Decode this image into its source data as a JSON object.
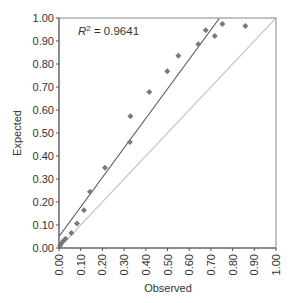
{
  "chart_data": {
    "type": "scatter",
    "title": "",
    "xlabel": "Observed",
    "ylabel": "Expected",
    "xlim": [
      0,
      1
    ],
    "ylim": [
      0,
      1
    ],
    "grid": false,
    "legend": null,
    "x_ticks": [
      "0.00",
      "0.10",
      "0.20",
      "0.30",
      "0.40",
      "0.50",
      "0.60",
      "0.70",
      "0.80",
      "0.90",
      "1.00"
    ],
    "y_ticks": [
      "0.00",
      "0.10",
      "0.20",
      "0.30",
      "0.40",
      "0.50",
      "0.60",
      "0.70",
      "0.80",
      "0.90",
      "1.00"
    ],
    "annotation": {
      "label": "R",
      "sup": "2",
      "text": " = 0.9641"
    },
    "series": [
      {
        "name": "data",
        "marker": "diamond",
        "color": "#7a7a7a",
        "points": [
          [
            0.005,
            0.01
          ],
          [
            0.01,
            0.02
          ],
          [
            0.02,
            0.03
          ],
          [
            0.03,
            0.04
          ],
          [
            0.057,
            0.065
          ],
          [
            0.083,
            0.106
          ],
          [
            0.115,
            0.164
          ],
          [
            0.143,
            0.245
          ],
          [
            0.212,
            0.349
          ],
          [
            0.327,
            0.461
          ],
          [
            0.329,
            0.573
          ],
          [
            0.416,
            0.678
          ],
          [
            0.499,
            0.768
          ],
          [
            0.55,
            0.836
          ],
          [
            0.642,
            0.886
          ],
          [
            0.676,
            0.947
          ],
          [
            0.718,
            0.922
          ],
          [
            0.753,
            0.974
          ],
          [
            0.859,
            0.965
          ]
        ]
      }
    ],
    "lines": [
      {
        "name": "regression",
        "color": "#555555",
        "from": [
          0,
          0.05
        ],
        "to": [
          0.74,
          1.0
        ]
      },
      {
        "name": "identity",
        "color": "#c8c8c8",
        "from": [
          0,
          0
        ],
        "to": [
          1,
          1
        ]
      }
    ]
  }
}
